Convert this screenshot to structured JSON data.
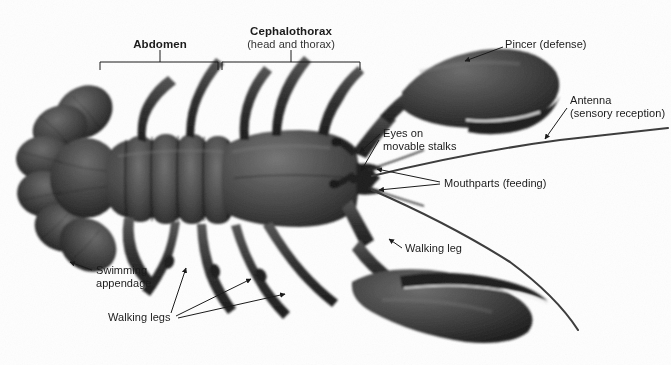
{
  "figure": {
    "background_color": "#fefefe",
    "ink_color": "#1b1b1b",
    "width": 671,
    "height": 365
  },
  "labels": {
    "abdomen": {
      "text": "Abdomen",
      "style": "bold"
    },
    "cephalothorax_title": {
      "text": "Cephalothorax",
      "style": "bold"
    },
    "cephalothorax_sub": {
      "text": "(head and thorax)",
      "style": "plain"
    },
    "pincer": {
      "text": "Pincer (defense)",
      "style": "plain"
    },
    "antenna_title": {
      "text": "Antenna",
      "style": "plain"
    },
    "antenna_sub": {
      "text": "(sensory reception)",
      "style": "plain"
    },
    "eyes_line1": {
      "text": "Eyes on",
      "style": "plain"
    },
    "eyes_line2": {
      "text": "movable stalks",
      "style": "plain"
    },
    "mouthparts": {
      "text": "Mouthparts (feeding)",
      "style": "plain"
    },
    "walking_leg": {
      "text": "Walking leg",
      "style": "plain"
    },
    "walking_legs": {
      "text": "Walking legs",
      "style": "plain"
    },
    "swimming_line1": {
      "text": "Swimming",
      "style": "plain"
    },
    "swimming_line2": {
      "text": "appendage",
      "style": "plain"
    }
  },
  "brackets": {
    "abdomen": {
      "x1": 100,
      "x2": 218,
      "y": 62,
      "tick_x": 160,
      "tick_top": 50
    },
    "cephalothorax": {
      "x1": 222,
      "x2": 360,
      "y": 62,
      "tick_x": 291,
      "tick_top": 50
    }
  },
  "leaders": {
    "pincer": {
      "label_x": 505,
      "label_y": 44,
      "tip_x": 461,
      "tip_y": 62
    },
    "antenna": {
      "label_x": 570,
      "label_y": 100,
      "tip_x": 542,
      "tip_y": 141
    },
    "eyes": {
      "label_x": 382,
      "label_y": 133,
      "tips": [
        [
          356,
          154
        ],
        [
          357,
          173
        ]
      ]
    },
    "mouthparts": {
      "label_x": 443,
      "label_y": 183,
      "tips": [
        [
          372,
          170
        ],
        [
          375,
          190
        ]
      ]
    },
    "walking_leg": {
      "label_x": 404,
      "label_y": 250,
      "tip_x": 386,
      "tip_y": 238
    },
    "walking_legs": {
      "label_x": 180,
      "label_y": 318,
      "tips": [
        [
          185,
          265
        ],
        [
          253,
          276
        ],
        [
          287,
          292
        ]
      ]
    },
    "swimming": {
      "label_x": 95,
      "label_y": 272,
      "tip_x": 67,
      "tip_y": 261
    }
  },
  "anatomy_parts": [
    "telson-and-uropods",
    "abdominal-segments",
    "carapace",
    "rostrum",
    "eyestalks",
    "mouthparts",
    "antennae",
    "antennules",
    "cheliped-left-large-claw",
    "cheliped-right-large-claw",
    "walking-legs",
    "swimmerets"
  ]
}
